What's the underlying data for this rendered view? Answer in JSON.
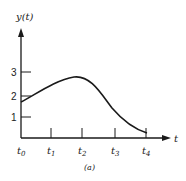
{
  "figure": {
    "y_axis_label": "y(t)",
    "x_axis_label": "t",
    "caption": "(a)",
    "y_ticks": [
      {
        "label": "3",
        "y": 72
      },
      {
        "label": "2",
        "y": 96
      },
      {
        "label": "1",
        "y": 117
      }
    ],
    "x_ticks": [
      {
        "label": "t",
        "sub": "0",
        "x": 21
      },
      {
        "label": "t",
        "sub": "1",
        "x": 51
      },
      {
        "label": "t",
        "sub": "2",
        "x": 82
      },
      {
        "label": "t",
        "sub": "3",
        "x": 115
      },
      {
        "label": "t",
        "sub": "4",
        "x": 146
      }
    ],
    "curve_color": "#1a1a1a",
    "axis_color": "#1a1a1a"
  }
}
